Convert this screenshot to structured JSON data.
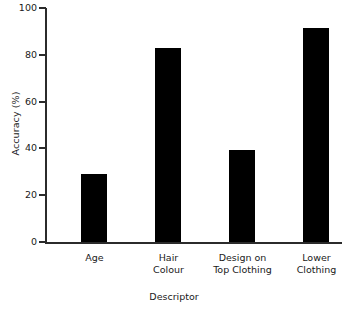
{
  "chart_data": {
    "type": "bar",
    "title": "",
    "xlabel": "Descriptor",
    "ylabel": "Accuracy (%)",
    "categories": [
      "Age",
      "Hair\nColour",
      "Design on\nTop Clothing",
      "Lower\nClothing"
    ],
    "values": [
      29,
      83,
      39.5,
      91.5
    ],
    "ylim": [
      0,
      100
    ],
    "yticks": [
      0,
      20,
      40,
      60,
      80,
      100
    ],
    "ytick_labels": [
      "0",
      "20",
      "40",
      "60",
      "80",
      "100"
    ],
    "grid": false,
    "legend": null,
    "bar_color": "#000000",
    "axis_color": "#2b2b2b"
  }
}
